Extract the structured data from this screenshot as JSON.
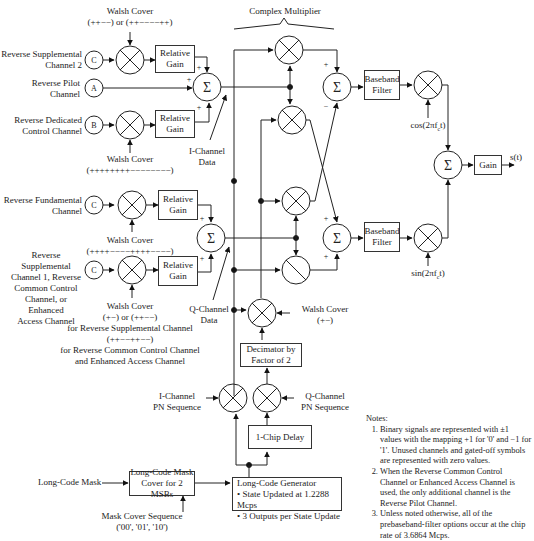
{
  "title": "Complex Multiplier",
  "inputs": {
    "supp2": {
      "label": "Reverse Supplemental\nChannel 2",
      "node": "C"
    },
    "pilot": {
      "label": "Reverse Pilot\nChannel",
      "node": "A"
    },
    "dcch": {
      "label": "Reverse Dedicated\nControl Channel",
      "node": "B"
    },
    "fund": {
      "label": "Reverse Fundamental\nChannel",
      "node": "C"
    },
    "supp1": {
      "label": "Reverse Supplemental\nChannel 1, Reverse\nCommon Control\nChannel, or Enhanced\nAccess Channel",
      "node": "C"
    }
  },
  "walsh": {
    "supp2": "Walsh Cover\n(++−−) or (++−−−−++)",
    "dcch": "Walsh Cover\n(++++++++−−−−−−−−)",
    "fund": "Walsh Cover\n(++++−−−−++++−−−−)",
    "supp1": "Walsh Cover\n(+−) or (++−−)\nfor Reverse Supplemental Channel\n(++−−++−−)\nfor Reverse Common Control Channel\nand Enhanced Access Channel",
    "q_decim": "Walsh Cover\n(+−)"
  },
  "blocks": {
    "relative_gain": "Relative\nGain",
    "baseband_filter": "Baseband\nFilter",
    "gain": "Gain",
    "decimator": "Decimator by\nFactor of 2",
    "chip_delay": "1-Chip Delay",
    "long_code_mask_cover": "Long-Code Mask\nCover for 2 MSBs",
    "long_code_gen_title": "Long-Code Generator",
    "long_code_gen_b1": "• State Updated at 1.2288 Mcps",
    "long_code_gen_b2": "• 3 Outputs per State Update"
  },
  "signals": {
    "i_data": "I-Channel\nData",
    "q_data": "Q-Channel\nData",
    "i_pn": "I-Channel\nPN Sequence",
    "q_pn": "Q-Channel\nPN Sequence",
    "cos": "cos(2πf",
    "cos_sub": "c",
    "cos_end": "t)",
    "sin": "sin(2πf",
    "sin_sub": "c",
    "sin_end": "t)",
    "output": "s(t)",
    "long_code_mask": "Long-Code Mask",
    "mask_cover_seq": "Mask Cover Sequence\n('00', '01', '10')"
  },
  "symbols": {
    "sum": "Σ",
    "plus": "+",
    "minus": "−"
  },
  "notes": {
    "heading": "Notes:",
    "items": [
      "Binary signals are represented with ±1 values with the mapping +1 for '0' and −1 for '1'. Unused channels and gated-off symbols are represented with zero values.",
      "When the Reverse Common Control Channel or Enhanced Access Channel is used, the only additional channel is the Reverse Pilot Channel.",
      "Unless noted otherwise, all of the prebaseband-filter options occur at the chip rate of 3.6864 Mcps."
    ]
  }
}
